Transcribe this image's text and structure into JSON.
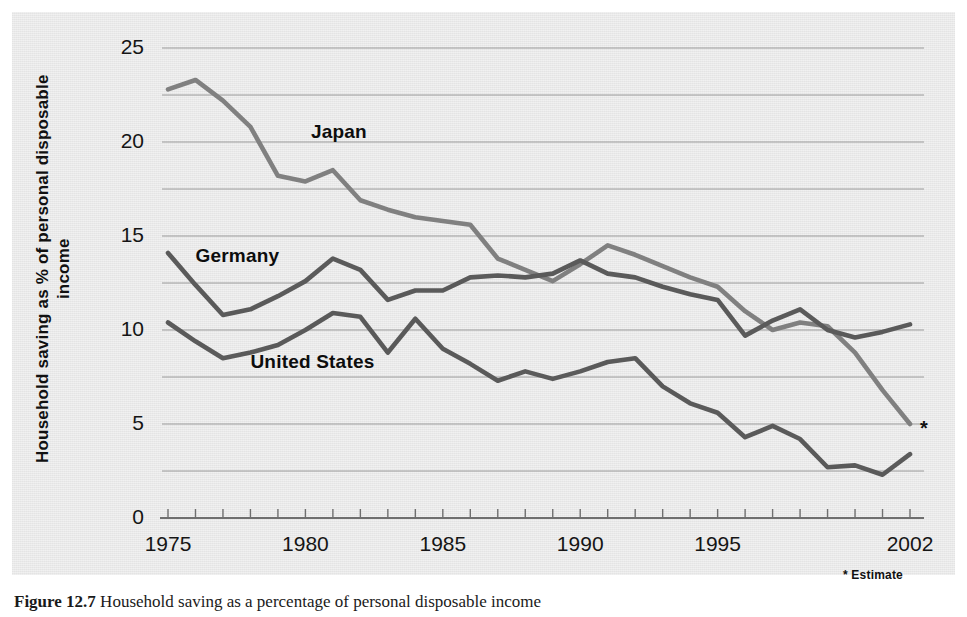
{
  "figure": {
    "caption_label": "Figure 12.7",
    "caption_text": "Household saving as a percentage of personal disposable income"
  },
  "axes": {
    "y_label": "Household saving as % of personal disposable income",
    "y_ticks": [
      25,
      20,
      15,
      10,
      5,
      0
    ],
    "y_minor_gridlines": [
      22.5,
      17.5,
      12.5,
      7.5,
      2.5
    ],
    "y_min": 0,
    "y_max": 25,
    "x_ticks": [
      1975,
      1980,
      1985,
      1990,
      1995,
      2002
    ],
    "x_min": 1975,
    "x_max": 2002,
    "x_tick_every": 1
  },
  "notes": {
    "estimate_footnote": "* Estimate",
    "estimate_marker": "*"
  },
  "colors": {
    "panel_background": "#e9e9e9",
    "gridline": "#9a9a9a",
    "axis_line": "#6f6f6f",
    "japan_line": "#808080",
    "germany_line": "#5a5a5a",
    "united_states_line": "#5a5a5a",
    "text": "#111111"
  },
  "series_labels": {
    "japan": "Japan",
    "germany": "Germany",
    "united_states": "United States"
  },
  "chart_data": {
    "type": "line",
    "title": "",
    "xlabel": "",
    "ylabel": "Household saving as % of personal disposable income",
    "xlim": [
      1975,
      2002
    ],
    "ylim": [
      0,
      25
    ],
    "grid": true,
    "legend": "inline-labels",
    "x": [
      1975,
      1976,
      1977,
      1978,
      1979,
      1980,
      1981,
      1982,
      1983,
      1984,
      1985,
      1986,
      1987,
      1988,
      1989,
      1990,
      1991,
      1992,
      1993,
      1994,
      1995,
      1996,
      1997,
      1998,
      1999,
      2000,
      2001,
      2002
    ],
    "series": [
      {
        "name": "Japan",
        "color": "#808080",
        "values": [
          22.8,
          23.3,
          22.2,
          20.8,
          18.2,
          17.9,
          18.5,
          16.9,
          16.4,
          16.0,
          15.8,
          15.6,
          13.8,
          13.2,
          12.6,
          13.5,
          14.5,
          14.0,
          13.4,
          12.8,
          12.3,
          11.0,
          10.0,
          10.4,
          10.2,
          8.8,
          6.8,
          5.0
        ]
      },
      {
        "name": "Germany",
        "color": "#5a5a5a",
        "values": [
          14.1,
          12.4,
          10.8,
          11.1,
          11.8,
          12.6,
          13.8,
          13.2,
          11.6,
          12.1,
          12.1,
          12.8,
          12.9,
          12.8,
          13.0,
          13.7,
          13.0,
          12.8,
          12.3,
          11.9,
          11.6,
          9.7,
          10.5,
          11.1,
          10.0,
          9.6,
          9.9,
          10.3
        ]
      },
      {
        "name": "United States",
        "color": "#5a5a5a",
        "values": [
          10.4,
          9.4,
          8.5,
          8.8,
          9.2,
          10.0,
          10.9,
          10.7,
          8.8,
          10.6,
          9.0,
          8.2,
          7.3,
          7.8,
          7.4,
          7.8,
          8.3,
          8.5,
          7.0,
          6.1,
          5.6,
          4.3,
          4.9,
          4.2,
          2.7,
          2.8,
          2.3,
          3.4
        ]
      }
    ],
    "annotations": [
      {
        "text": "*",
        "at_x": 2002,
        "at_y": 5.0,
        "meaning": "Estimate"
      }
    ]
  }
}
